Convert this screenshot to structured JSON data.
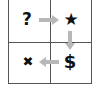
{
  "diagram": {
    "type": "2x2 grid flow",
    "cells": [
      {
        "position": "top-left",
        "symbol": "?",
        "icon": "question-mark-icon"
      },
      {
        "position": "top-right",
        "symbol": "★",
        "icon": "star-icon"
      },
      {
        "position": "bottom-left",
        "symbol": "✖",
        "icon": "x-mark-icon"
      },
      {
        "position": "bottom-right",
        "symbol": "$",
        "icon": "dollar-icon"
      }
    ],
    "arrows": [
      {
        "from": "top-left",
        "to": "top-right",
        "direction": "right"
      },
      {
        "from": "top-right",
        "to": "bottom-right",
        "direction": "down"
      },
      {
        "from": "bottom-right",
        "to": "bottom-left",
        "direction": "left"
      }
    ],
    "colors": {
      "grid_line": "#555555",
      "arrow": "#b8b8b8",
      "symbol": "#111111",
      "background": "#ffffff"
    }
  }
}
